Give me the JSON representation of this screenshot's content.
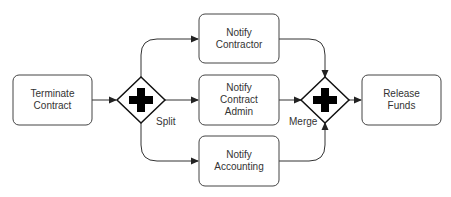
{
  "diagram": {
    "type": "bpmn-process",
    "colors": {
      "stroke": "#222222",
      "fill": "#ffffff",
      "text": "#333333",
      "gateway_marker": "#000000"
    },
    "nodes": {
      "terminate": {
        "line1": "Terminate",
        "line2": "Contract",
        "line3": ""
      },
      "contractor": {
        "line1": "Notify",
        "line2": "Contractor",
        "line3": ""
      },
      "admin": {
        "line1": "Notify",
        "line2": "Contract",
        "line3": "Admin"
      },
      "accounting": {
        "line1": "Notify",
        "line2": "Accounting",
        "line3": ""
      },
      "release": {
        "line1": "Release",
        "line2": "Funds",
        "line3": ""
      }
    },
    "gateways": {
      "split": {
        "label": "Split",
        "kind": "parallel"
      },
      "merge": {
        "label": "Merge",
        "kind": "parallel"
      }
    },
    "edges": [
      {
        "from": "terminate",
        "to": "split"
      },
      {
        "from": "split",
        "to": "contractor"
      },
      {
        "from": "split",
        "to": "admin"
      },
      {
        "from": "split",
        "to": "accounting"
      },
      {
        "from": "contractor",
        "to": "merge"
      },
      {
        "from": "admin",
        "to": "merge"
      },
      {
        "from": "accounting",
        "to": "merge"
      },
      {
        "from": "merge",
        "to": "release"
      }
    ]
  }
}
